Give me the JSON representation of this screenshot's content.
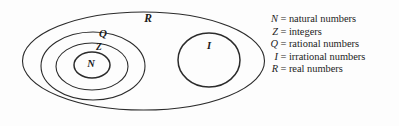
{
  "figure": {
    "background_color": "#fdfdfd",
    "stroke_color": "#2b2b2b",
    "text_color": "#1c1c1c"
  },
  "diagram": {
    "sets": [
      {
        "id": "R",
        "label": "R",
        "name": "real numbers",
        "shape": "ellipse",
        "cx": 143.5,
        "cy": 61,
        "rx": 121,
        "ry": 49,
        "label_x": 148,
        "label_y": 19,
        "label_size": 11.5
      },
      {
        "id": "Q",
        "label": "Q",
        "name": "rational numbers",
        "shape": "ellipse",
        "cx": 93,
        "cy": 66,
        "rx": 52,
        "ry": 34,
        "label_x": 103,
        "label_y": 34,
        "label_size": 11
      },
      {
        "id": "Z",
        "label": "Z",
        "name": "integers",
        "shape": "ellipse",
        "cx": 92,
        "cy": 66.5,
        "rx": 36,
        "ry": 23.5,
        "label_x": 99,
        "label_y": 48,
        "label_size": 9.5
      },
      {
        "id": "N",
        "label": "N",
        "name": "natural numbers",
        "shape": "ellipse",
        "cx": 92,
        "cy": 65,
        "rx": 18,
        "ry": 13,
        "label_x": 91,
        "label_y": 65,
        "label_size": 10.5
      },
      {
        "id": "I",
        "label": "I",
        "name": "irrational numbers",
        "shape": "ellipse",
        "cx": 209,
        "cy": 60,
        "rx": 31,
        "ry": 27,
        "label_x": 209,
        "label_y": 47,
        "label_size": 10.5
      }
    ],
    "stroke_widths": {
      "R": 1.1,
      "Q": 1.1,
      "Z": 1.1,
      "N": 1.5,
      "I": 1.5
    }
  },
  "legend": {
    "items": [
      {
        "symbol": "N",
        "equals": "=",
        "description": "natural numbers"
      },
      {
        "symbol": "Z",
        "equals": "=",
        "description": "integers"
      },
      {
        "symbol": "Q",
        "equals": "=",
        "description": "rational numbers"
      },
      {
        "symbol": "I",
        "equals": "=",
        "description": "irrational numbers"
      },
      {
        "symbol": "R",
        "equals": "=",
        "description": "real numbers"
      }
    ]
  }
}
